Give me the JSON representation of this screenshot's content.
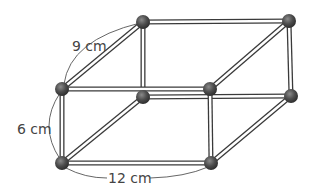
{
  "diagram": {
    "type": "rectangular-prism-skeleton",
    "dimensions": {
      "depth_label": "9 cm",
      "height_label": "6 cm",
      "length_label": "12 cm"
    },
    "colors": {
      "rod_outline": "#3a3a3a",
      "rod_fill": "#ffffff",
      "ball": "#4a4a4a",
      "ball_highlight": "#7a7a7a",
      "dimension_line": "#555555",
      "label_text": "#444444"
    },
    "vertex_count": 8,
    "edge_count": 12
  }
}
